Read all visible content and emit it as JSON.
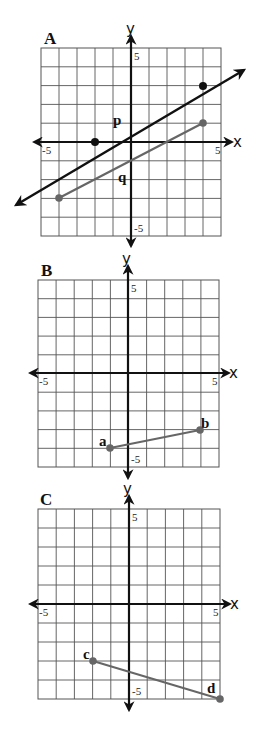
{
  "panels": [
    {
      "label": "A",
      "x_axis_label": "x",
      "y_axis_label": "y",
      "tick_x_min": "-5",
      "tick_x_max": "5",
      "tick_y_max": "5",
      "tick_y_min": "-5",
      "line_p_label": "p",
      "segment_q_label": "q"
    },
    {
      "label": "B",
      "x_axis_label": "x",
      "y_axis_label": "y",
      "tick_x_min": "-5",
      "tick_x_max": "5",
      "tick_y_max": "5",
      "tick_y_min": "-5",
      "point_a_label": "a",
      "point_b_label": "b"
    },
    {
      "label": "C",
      "x_axis_label": "x",
      "y_axis_label": "y",
      "tick_x_min": "-5",
      "tick_x_max": "5",
      "tick_y_max": "5",
      "tick_y_min": "-5",
      "point_c_label": "c",
      "point_d_label": "d"
    }
  ],
  "colors": {
    "grid": "#555555",
    "axis": "#111111",
    "line_p": "#111111",
    "segment": "#666666"
  },
  "chart_data": [
    {
      "type": "line",
      "title": "A",
      "xlabel": "x",
      "ylabel": "y",
      "xlim": [
        -5,
        5
      ],
      "ylim": [
        -5,
        5
      ],
      "grid": true,
      "series": [
        {
          "name": "p",
          "kind": "line (arrows both ends)",
          "points": [
            [
              -2,
              0
            ],
            [
              4,
              3
            ]
          ],
          "slope": 0.5,
          "y_intercept": 1
        },
        {
          "name": "q",
          "kind": "segment",
          "points": [
            [
              -4,
              -3
            ],
            [
              4,
              1
            ]
          ],
          "slope": 0.5
        }
      ]
    },
    {
      "type": "line",
      "title": "B",
      "xlabel": "x",
      "ylabel": "y",
      "xlim": [
        -5,
        5
      ],
      "ylim": [
        -5,
        5
      ],
      "grid": true,
      "series": [
        {
          "name": "ab",
          "kind": "segment",
          "points": [
            [
              -1,
              -4
            ],
            [
              4,
              -3
            ]
          ],
          "point_labels": [
            "a",
            "b"
          ]
        }
      ]
    },
    {
      "type": "line",
      "title": "C",
      "xlabel": "x",
      "ylabel": "y",
      "xlim": [
        -5,
        5
      ],
      "ylim": [
        -5,
        5
      ],
      "grid": true,
      "series": [
        {
          "name": "cd",
          "kind": "segment",
          "points": [
            [
              -2,
              -3
            ],
            [
              5,
              -5
            ]
          ],
          "point_labels": [
            "c",
            "d"
          ]
        }
      ]
    }
  ]
}
